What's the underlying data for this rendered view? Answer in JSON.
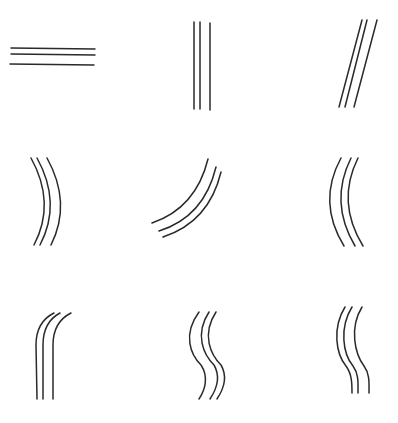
{
  "figure": {
    "stroke_color": "#2a2a2a",
    "background": "#ffffff",
    "grid": {
      "rows": 3,
      "cols": 3
    },
    "panels": [
      {
        "id": "horizontal-lines",
        "shape": "straight horizontal",
        "paths": [
          "M11 48 L95 49",
          "M11 54 L95 55",
          "M10 64 L94 65"
        ]
      },
      {
        "id": "vertical-lines",
        "shape": "straight vertical",
        "paths": [
          "M194 22 L194 109",
          "M200 22 L200 109",
          "M210 23 L210 110"
        ]
      },
      {
        "id": "diagonal-lines",
        "shape": "straight slanted",
        "paths": [
          "M362 20 L339 107",
          "M367 20 L345 107",
          "M377 20 L354 107"
        ]
      },
      {
        "id": "right-bulging-arcs",
        "shape": "curved, convex to the right",
        "paths": [
          "M31 158 Q56 203 34 245",
          "M37 158 Q62 203 40 245",
          "M47 158 Q72 203 51 245"
        ]
      },
      {
        "id": "sweeping-curves",
        "shape": "curved sweep from upper right to lower left",
        "paths": [
          "M208 159 Q196 208 152 223",
          "M216 167 Q204 217 159 231",
          "M221 172 Q209 222 163 237"
        ]
      },
      {
        "id": "left-bulging-arcs",
        "shape": "curved, convex to the left",
        "paths": [
          "M341 158 Q317 202 344 246",
          "M351 158 Q329 202 355 246",
          "M358 158 Q336 202 363 246"
        ]
      },
      {
        "id": "hook-lines",
        "shape": "vertical stems bending right at the top",
        "paths": [
          "M37 399 L36 345 Q36 322 54 313",
          "M43 399 L43 345 Q43 322 60 313",
          "M53 399 L53 345 Q53 322 71 313"
        ]
      },
      {
        "id": "s-curves",
        "shape": "S-shaped waves",
        "paths": [
          "M199 312 C182 335 191 355 201 365 C209 377 205 390 199 399",
          "M209 312 C194 335 204 355 214 365 C221 377 216 390 210 399",
          "M216 312 C201 335 211 355 221 365 C228 377 223 390 217 399"
        ]
      },
      {
        "id": "reverse-s-curves",
        "shape": "bowed left at top, straightening downward",
        "paths": [
          "M345 307 C332 328 336 354 346 366 C352 374 352 384 352 393",
          "M352 307 C339 328 343 354 353 366 C359 374 358 384 358 393",
          "M362 307 C349 328 355 354 364 366 C370 374 369 384 369 393"
        ]
      }
    ]
  }
}
